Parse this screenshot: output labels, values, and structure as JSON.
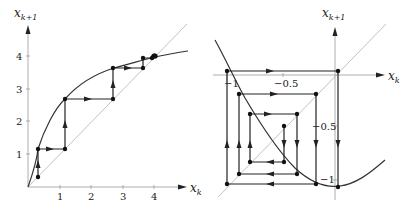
{
  "panels": [
    {
      "id": "left",
      "description": "Cobweb diagram of iteration converging monotonically to a fixed point near x=4",
      "x_axis_label": "x",
      "x_axis_sub": "k",
      "y_axis_label": "x",
      "y_axis_sub": "k+1",
      "x_ticks": [
        "1",
        "2",
        "3",
        "4"
      ],
      "y_ticks": [
        "1",
        "2",
        "3",
        "4"
      ],
      "curve": "concave increasing function through origin",
      "diagonal": "x_{k+1} = x_k",
      "iterates": [
        0.3,
        1.15,
        2.7,
        3.65,
        3.92,
        3.98
      ]
    },
    {
      "id": "right",
      "description": "Cobweb diagram of iteration spiraling outward away from fixed point (divergent oscillation)",
      "x_axis_label": "x",
      "x_axis_sub": "k",
      "y_axis_label": "x",
      "y_axis_sub": "k+1",
      "x_ticks": [
        "−1",
        "−0.5"
      ],
      "y_ticks": [
        "−0.5",
        "−1"
      ],
      "curve": "convex parabola-like decreasing function",
      "diagonal": "x_{k+1} = x_k",
      "iterates": [
        -0.6,
        -0.9,
        -0.75,
        -1.05,
        -0.9,
        -1.15,
        0,
        -1.2
      ]
    }
  ],
  "colors": {
    "curve": "#333333",
    "diagonal": "#bbbbbb",
    "axes": "#999999",
    "cobweb": "#222222"
  }
}
